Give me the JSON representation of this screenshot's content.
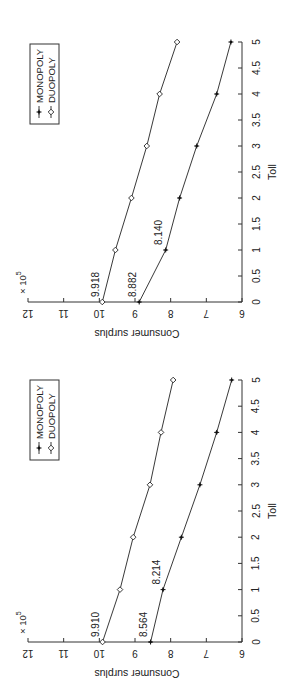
{
  "figure": {
    "orientation": "rotated 90 degrees counter-clockwise",
    "panels": 2
  },
  "chart_data": [
    {
      "type": "line",
      "title": "",
      "xlabel": "Toll",
      "ylabel": "Consumer surplus",
      "y_multiplier": "× 10^5",
      "x": [
        0,
        1,
        2,
        3,
        4,
        5
      ],
      "xticks": [
        "0",
        "0.5",
        "1",
        "1.5",
        "2",
        "2.5",
        "3",
        "3.5",
        "4",
        "4.5",
        "5"
      ],
      "yticks": [
        "6",
        "7",
        "8",
        "9",
        "10",
        "11",
        "12"
      ],
      "xlim": [
        0,
        5
      ],
      "ylim": [
        6,
        12
      ],
      "grid": false,
      "legend_position": "upper right",
      "series": [
        {
          "name": "MONOPOLY",
          "marker": "star",
          "values": [
            8.564,
            8.214,
            7.7,
            7.18,
            6.71,
            6.29
          ]
        },
        {
          "name": "DUOPOLY",
          "marker": "diamond",
          "values": [
            9.91,
            9.42,
            9.05,
            8.58,
            8.27,
            7.93
          ]
        }
      ],
      "annotations": [
        {
          "text": "9.910",
          "x": 0,
          "y": 9.91
        },
        {
          "text": "8.564",
          "x": 0,
          "y": 8.564
        },
        {
          "text": "8.214",
          "x": 1,
          "y": 8.214
        }
      ]
    },
    {
      "type": "line",
      "title": "",
      "xlabel": "Toll",
      "ylabel": "Consumer surplus",
      "y_multiplier": "× 10^5",
      "x": [
        0,
        1,
        2,
        3,
        4,
        5
      ],
      "xticks": [
        "0",
        "0.5",
        "1",
        "1.5",
        "2",
        "2.5",
        "3",
        "3.5",
        "4",
        "4.5",
        "5"
      ],
      "yticks": [
        "6",
        "7",
        "8",
        "9",
        "10",
        "11",
        "12"
      ],
      "xlim": [
        0,
        5
      ],
      "ylim": [
        6,
        12
      ],
      "grid": false,
      "legend_position": "upper right",
      "series": [
        {
          "name": "MONOPOLY",
          "marker": "star",
          "values": [
            8.882,
            8.14,
            7.75,
            7.27,
            6.71,
            6.31
          ]
        },
        {
          "name": "DUOPOLY",
          "marker": "diamond",
          "values": [
            9.918,
            9.55,
            9.1,
            8.67,
            8.31,
            7.82
          ]
        }
      ],
      "annotations": [
        {
          "text": "9.918",
          "x": 0,
          "y": 9.918
        },
        {
          "text": "8.882",
          "x": 0,
          "y": 8.882
        },
        {
          "text": "8.140",
          "x": 1,
          "y": 8.14
        }
      ]
    }
  ],
  "labels": {
    "xlabel": "Toll",
    "ylabel": "Consumer surplus",
    "multiplier_base": "× 10",
    "multiplier_exp": "5",
    "legend": [
      "MONOPOLY",
      "DUOPOLY"
    ]
  },
  "colors": {
    "line": "#222222",
    "axis": "#333333",
    "background": "#ffffff"
  }
}
